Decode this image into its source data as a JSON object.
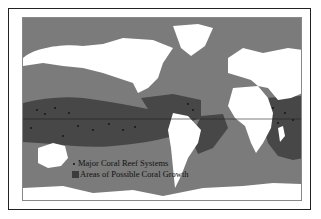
{
  "map": {
    "title": "Coral reef distribution world map",
    "colors": {
      "ocean": "#7b7b7b",
      "coral_zone": "#474747",
      "land": "#ffffff",
      "reef_dot": "#111111",
      "equator": "#222222"
    },
    "legend": {
      "items": [
        {
          "symbol": "dot",
          "label": "Major Coral Reef Systems"
        },
        {
          "symbol": "square",
          "label": "Areas of Possible Coral Growth"
        }
      ]
    }
  }
}
